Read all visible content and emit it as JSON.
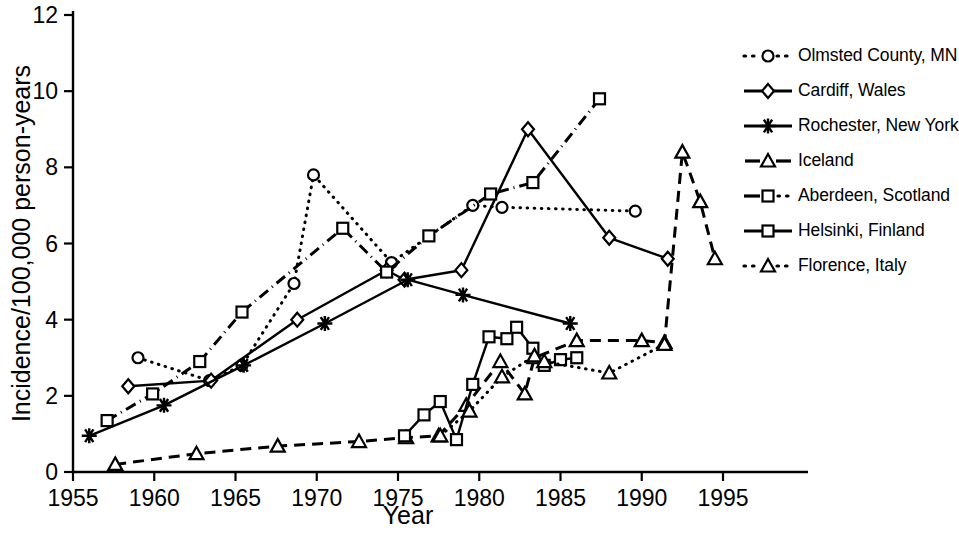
{
  "chart_data": {
    "type": "line",
    "title": "",
    "xlabel": "Year",
    "ylabel": "Incidence/100,000 person-years",
    "xlim": [
      1955,
      1996
    ],
    "ylim": [
      0,
      12
    ],
    "xticks": [
      1955,
      1960,
      1965,
      1970,
      1975,
      1980,
      1985,
      1990,
      1995
    ],
    "yticks": [
      0,
      2,
      4,
      6,
      8,
      10,
      12
    ],
    "grid": false,
    "legend_position": "right",
    "series": [
      {
        "name": "Olmsted County, MN",
        "marker": "open-circle",
        "line": "dotted",
        "points": [
          [
            1959.0,
            3.0
          ],
          [
            1963.4,
            2.4
          ],
          [
            1965.4,
            2.8
          ],
          [
            1968.6,
            4.95
          ],
          [
            1969.8,
            7.8
          ],
          [
            1974.6,
            5.5
          ],
          [
            1979.6,
            7.0
          ],
          [
            1981.4,
            6.95
          ],
          [
            1989.6,
            6.85
          ]
        ]
      },
      {
        "name": "Cardiff, Wales",
        "marker": "open-diamond",
        "line": "solid",
        "points": [
          [
            1958.4,
            2.25
          ],
          [
            1963.5,
            2.4
          ],
          [
            1968.8,
            4.0
          ],
          [
            1974.3,
            5.3
          ],
          [
            1975.4,
            5.05
          ],
          [
            1978.9,
            5.3
          ],
          [
            1983.0,
            9.0
          ],
          [
            1988.0,
            6.15
          ],
          [
            1991.6,
            5.6
          ]
        ]
      },
      {
        "name": "Rochester, New York",
        "marker": "star",
        "line": "solid",
        "points": [
          [
            1956.0,
            0.95
          ],
          [
            1960.6,
            1.75
          ],
          [
            1965.5,
            2.8
          ],
          [
            1970.5,
            3.9
          ],
          [
            1975.6,
            5.05
          ],
          [
            1979.0,
            4.65
          ],
          [
            1985.6,
            3.9
          ]
        ]
      },
      {
        "name": "Iceland",
        "marker": "open-triangle",
        "line": "dashed",
        "points": [
          [
            1957.6,
            0.2
          ],
          [
            1962.6,
            0.48
          ],
          [
            1967.6,
            0.68
          ],
          [
            1972.6,
            0.8
          ],
          [
            1975.5,
            0.9
          ],
          [
            1977.5,
            0.95
          ],
          [
            1979.2,
            1.75
          ],
          [
            1981.3,
            2.9
          ],
          [
            1982.8,
            2.05
          ],
          [
            1983.4,
            3.0
          ],
          [
            1986.0,
            3.45
          ],
          [
            1990.0,
            3.45
          ],
          [
            1991.4,
            3.4
          ],
          [
            1992.5,
            8.4
          ],
          [
            1993.6,
            7.1
          ],
          [
            1994.5,
            5.6
          ]
        ]
      },
      {
        "name": "Aberdeen, Scotland",
        "marker": "open-square",
        "line": "dash-dot",
        "points": [
          [
            1957.1,
            1.35
          ],
          [
            1959.9,
            2.05
          ],
          [
            1962.8,
            2.9
          ],
          [
            1965.4,
            4.2
          ],
          [
            1971.6,
            6.4
          ],
          [
            1974.3,
            5.25
          ],
          [
            1976.9,
            6.2
          ],
          [
            1980.7,
            7.3
          ],
          [
            1983.3,
            7.6
          ],
          [
            1987.4,
            9.8
          ]
        ]
      },
      {
        "name": "Helsinki, Finland",
        "marker": "open-square",
        "line": "solid",
        "points": [
          [
            1975.4,
            0.95
          ],
          [
            1976.6,
            1.5
          ],
          [
            1977.6,
            1.85
          ],
          [
            1978.6,
            0.85
          ],
          [
            1979.6,
            2.3
          ],
          [
            1980.6,
            3.55
          ],
          [
            1981.7,
            3.5
          ],
          [
            1982.3,
            3.8
          ],
          [
            1983.3,
            3.25
          ],
          [
            1984.0,
            2.8
          ],
          [
            1985.0,
            2.95
          ],
          [
            1986.0,
            3.0
          ]
        ]
      },
      {
        "name": "Florence, Italy",
        "marker": "open-triangle",
        "line": "dotted",
        "points": [
          [
            1977.6,
            0.95
          ],
          [
            1979.4,
            1.6
          ],
          [
            1981.4,
            2.5
          ],
          [
            1983.4,
            3.05
          ],
          [
            1984.0,
            2.9
          ],
          [
            1988.0,
            2.6
          ],
          [
            1991.4,
            3.35
          ]
        ]
      }
    ]
  },
  "axes": {
    "x_tick_labels": [
      "1955",
      "1960",
      "1965",
      "1970",
      "1975",
      "1980",
      "1985",
      "1990",
      "1995"
    ],
    "y_tick_labels": [
      "0",
      "2",
      "4",
      "6",
      "8",
      "10",
      "12"
    ],
    "x_axis_title": "Year",
    "y_axis_title": "Incidence/100,000 person-years"
  },
  "legend": {
    "items": [
      {
        "label": "Olmsted County, MN",
        "marker": "open-circle",
        "line": "dotted"
      },
      {
        "label": "Cardiff, Wales",
        "marker": "open-diamond",
        "line": "solid"
      },
      {
        "label": "Rochester, New York",
        "marker": "star",
        "line": "solid"
      },
      {
        "label": "Iceland",
        "marker": "open-triangle",
        "line": "dashed"
      },
      {
        "label": "Aberdeen, Scotland",
        "marker": "open-square",
        "line": "dash-dot"
      },
      {
        "label": "Helsinki, Finland",
        "marker": "open-square",
        "line": "solid"
      },
      {
        "label": "Florence, Italy",
        "marker": "open-triangle",
        "line": "dotted"
      }
    ]
  },
  "colors": {
    "ink": "#000000",
    "background": "#ffffff"
  }
}
